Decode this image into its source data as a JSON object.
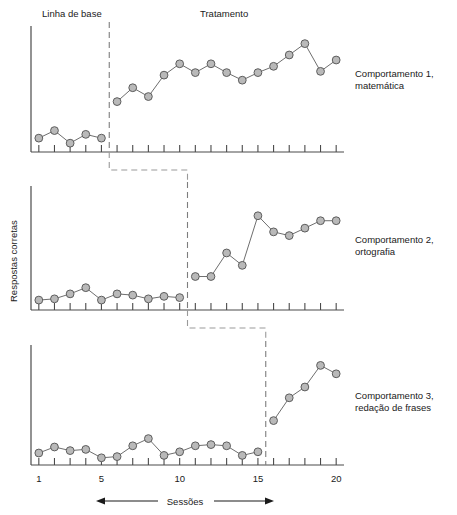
{
  "figure": {
    "type": "multiple-baseline-design",
    "phase_labels": {
      "baseline": "Linha de base",
      "treatment": "Tratamento"
    },
    "y_axis_title": "Respostas corretas",
    "x_axis_title": "Sessões",
    "panel_labels": [
      "Comportamento 1,\nmatemática",
      "Comportamento 2,\nortografia",
      "Comportamento 3,\nredação de frases"
    ],
    "panel_labels_lines": [
      [
        "Comportamento 1,",
        "matemática"
      ],
      [
        "Comportamento 2,",
        "ortografia"
      ],
      [
        "Comportamento 3,",
        "redação de frases"
      ]
    ],
    "x_tick_labels": [
      "1",
      "5",
      "10",
      "15",
      "20"
    ],
    "x_tick_label_values": [
      1,
      5,
      10,
      15,
      20
    ],
    "colors": {
      "marker_fill": "#b9b9b9",
      "marker_stroke": "#5d5d5d",
      "series_line": "#6e6e6e",
      "axis": "#4a4a4a",
      "phase_line": "#7d7d7d",
      "connector": "#9a9a9a",
      "text": "#1a1a1a",
      "background": "#ffffff"
    }
  },
  "chart_data": {
    "type": "line",
    "title": "",
    "xlabel": "Sessões",
    "ylabel": "Respostas corretas",
    "xlim": [
      0.5,
      20.5
    ],
    "ylim": [
      0,
      10
    ],
    "grid": false,
    "legend": "none",
    "x": [
      1,
      2,
      3,
      4,
      5,
      6,
      7,
      8,
      9,
      10,
      11,
      12,
      13,
      14,
      15,
      16,
      17,
      18,
      19,
      20
    ],
    "panels": [
      {
        "name": "Comportamento 1, matemática",
        "phase_change_after_session": 5,
        "baseline_label": "Linha de base",
        "treatment_label": "Tratamento",
        "series": [
          {
            "name": "Linha de base",
            "x": [
              1,
              2,
              3,
              4,
              5
            ],
            "values": [
              1.1,
              1.7,
              0.7,
              1.4,
              1.1
            ]
          },
          {
            "name": "Tratamento",
            "x": [
              6,
              7,
              8,
              9,
              10,
              11,
              12,
              13,
              14,
              15,
              16,
              17,
              18,
              19,
              20
            ],
            "values": [
              4.0,
              5.1,
              4.4,
              6.1,
              7.0,
              6.3,
              7.0,
              6.3,
              5.7,
              6.3,
              6.8,
              7.7,
              8.6,
              6.4,
              7.3
            ]
          }
        ]
      },
      {
        "name": "Comportamento 2, ortografia",
        "phase_change_after_session": 10,
        "series": [
          {
            "name": "Linha de base",
            "x": [
              1,
              2,
              3,
              4,
              5,
              6,
              7,
              8,
              9,
              10
            ],
            "values": [
              0.8,
              0.9,
              1.3,
              1.8,
              0.8,
              1.3,
              1.2,
              0.9,
              1.1,
              1.0
            ]
          },
          {
            "name": "Tratamento",
            "x": [
              11,
              12,
              13,
              14,
              15,
              16,
              17,
              18,
              19,
              20
            ],
            "values": [
              2.7,
              2.7,
              4.6,
              3.6,
              7.6,
              6.3,
              6.0,
              6.6,
              7.2,
              7.2
            ]
          }
        ]
      },
      {
        "name": "Comportamento 3, redação de frases",
        "phase_change_after_session": 15,
        "series": [
          {
            "name": "Linha de base",
            "x": [
              1,
              2,
              3,
              4,
              5,
              6,
              7,
              8,
              9,
              10,
              11,
              12,
              13,
              14,
              15
            ],
            "values": [
              1.0,
              1.5,
              1.2,
              1.3,
              0.6,
              0.7,
              1.6,
              2.2,
              0.8,
              1.1,
              1.6,
              1.7,
              1.6,
              0.8,
              1.1
            ]
          },
          {
            "name": "Tratamento",
            "x": [
              16,
              17,
              18,
              19,
              20
            ],
            "values": [
              3.7,
              5.6,
              6.5,
              8.3,
              7.6
            ]
          }
        ]
      }
    ]
  }
}
